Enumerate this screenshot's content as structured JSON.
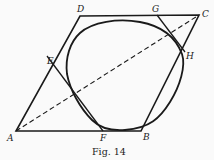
{
  "figure": {
    "caption": "Fig. 14",
    "labels": {
      "A": "A",
      "B": "B",
      "C": "C",
      "D": "D",
      "E": "E",
      "F": "F",
      "G": "G",
      "H": "H"
    },
    "points": {
      "A": [
        16,
        131
      ],
      "B": [
        141,
        131
      ],
      "C": [
        199,
        15
      ],
      "D": [
        80,
        16
      ],
      "E": [
        53,
        64
      ],
      "F": [
        101,
        131
      ],
      "G": [
        157,
        15
      ],
      "H": [
        184,
        51
      ]
    },
    "colors": {
      "stroke": "#1a1a1a",
      "background": "#fafafa"
    }
  }
}
